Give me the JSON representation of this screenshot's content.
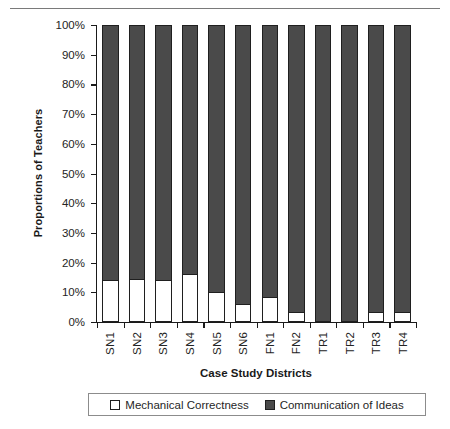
{
  "chart_data": {
    "type": "bar",
    "subtype": "stacked-100-percent",
    "title": "",
    "xlabel": "Case Study Districts",
    "ylabel": "Proportions of Teachers",
    "categories": [
      "SN1",
      "SN2",
      "SN3",
      "SN4",
      "SN5",
      "SN6",
      "FN1",
      "FN2",
      "TR1",
      "TR2",
      "TR3",
      "TR4"
    ],
    "series": [
      {
        "name": "Mechanical Correctness",
        "color": "#ffffff",
        "values": [
          14,
          14.5,
          14,
          16,
          10,
          6,
          8.5,
          3.5,
          0,
          0,
          3.5,
          3.5
        ]
      },
      {
        "name": "Communication of Ideas",
        "color": "#4a4a4a",
        "values": [
          86,
          85.5,
          86,
          84,
          90,
          94,
          91.5,
          96.5,
          100,
          100,
          96.5,
          96.5
        ]
      }
    ],
    "ylim": [
      0,
      100
    ],
    "ytick_labels": [
      "0%",
      "10%",
      "20%",
      "30%",
      "40%",
      "50%",
      "60%",
      "70%",
      "80%",
      "90%",
      "100%"
    ],
    "ytick_values": [
      0,
      10,
      20,
      30,
      40,
      50,
      60,
      70,
      80,
      90,
      100
    ],
    "grid": false,
    "legend_position": "bottom",
    "legend": [
      "Mechanical Correctness",
      "Communication of Ideas"
    ]
  },
  "colors": {
    "dark_fill": "#4a4a4a",
    "light_fill": "#ffffff",
    "outline": "#1f1f1f",
    "axis": "#1a1a1a",
    "rule": "#7a7a7a"
  }
}
